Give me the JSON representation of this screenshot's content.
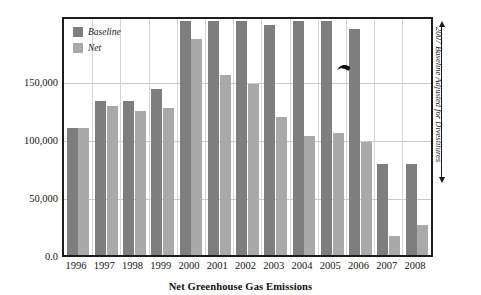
{
  "chart_data": {
    "type": "bar",
    "title": "",
    "xlabel": "Net Greenhouse Gas Emissions",
    "ylabel": "",
    "categories": [
      "1996",
      "1997",
      "1998",
      "1999",
      "2000",
      "2001",
      "2002",
      "2003",
      "2004",
      "2005",
      "2006",
      "2007",
      "2008"
    ],
    "series": [
      {
        "name": "Baseline",
        "color": "#7e7e7e",
        "values": [
          102000,
          124000,
          124000,
          134000,
          188000,
          188000,
          188000,
          185000,
          188000,
          188000,
          182000,
          73000,
          73000
        ]
      },
      {
        "name": "Net",
        "color": "#a9a9a9",
        "values": [
          102000,
          120000,
          116000,
          118000,
          174000,
          145000,
          138000,
          111000,
          96000,
          98000,
          91000,
          15000,
          24000
        ]
      }
    ],
    "ylim": [
      0,
      190000
    ],
    "yticks": [
      "0.0",
      "50,000",
      "100,000",
      "150,000"
    ],
    "ytick_values": [
      0,
      50000,
      100000,
      150000
    ],
    "grid": true,
    "legend_position": "top-left",
    "annotations": [
      {
        "text": "2007 Baseline Adjusted for Divestitures",
        "orientation": "vertical",
        "position": "right"
      }
    ]
  },
  "legend": {
    "items": [
      {
        "label": "Baseline",
        "color": "#7e7e7e"
      },
      {
        "label": "Net",
        "color": "#a9a9a9"
      }
    ]
  },
  "axis": {
    "x_title": "Net Greenhouse Gas Emissions"
  },
  "cursor": {
    "icon": "mouse-pointer-arrow"
  }
}
